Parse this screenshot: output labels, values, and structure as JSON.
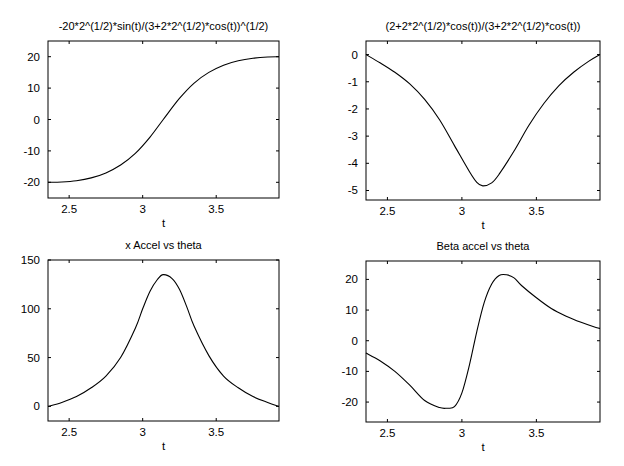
{
  "chart_data": [
    {
      "type": "line",
      "id": "tl",
      "title": "-20*2^(1/2)*sin(t)/(3+2*2^(1/2)*cos(t))^(1/2)",
      "xlabel": "t",
      "ylabel": "",
      "xlim": [
        2.3562,
        3.927
      ],
      "ylim": [
        -25,
        25
      ],
      "xticks": [
        2.5,
        3,
        3.5
      ],
      "xtick_labels": [
        "2.5",
        "3",
        "3.5"
      ],
      "yticks": [
        20,
        10,
        0,
        -10,
        -20
      ],
      "ytick_labels": [
        "20",
        "10",
        "0",
        "-10",
        "-20"
      ],
      "box": {
        "left": 48,
        "top": 41,
        "right": 279,
        "bottom": 198
      },
      "x": [
        2.356,
        2.45,
        2.55,
        2.65,
        2.75,
        2.85,
        2.95,
        3.05,
        3.14,
        3.25,
        3.35,
        3.45,
        3.55,
        3.65,
        3.75,
        3.85,
        3.927
      ],
      "values": [
        -20,
        -19.9,
        -19.5,
        -18.6,
        -17.0,
        -14.5,
        -10.8,
        -5.6,
        0,
        6.7,
        11.6,
        15.0,
        17.3,
        18.7,
        19.5,
        19.9,
        20
      ]
    },
    {
      "type": "line",
      "id": "tr",
      "title": "(2+2*2^(1/2)*cos(t))/(3+2*2^(1/2)*cos(t))",
      "xlabel": "t",
      "ylabel": "",
      "xlim": [
        2.3562,
        3.927
      ],
      "ylim": [
        -5.35,
        0.5
      ],
      "xticks": [
        2.5,
        3,
        3.5
      ],
      "xtick_labels": [
        "2.5",
        "3",
        "3.5"
      ],
      "yticks": [
        0,
        -1,
        -2,
        -3,
        -4,
        -5
      ],
      "ytick_labels": [
        "0",
        "-1",
        "-2",
        "-3",
        "-4",
        "-5"
      ],
      "box": {
        "left": 366,
        "top": 41,
        "right": 600,
        "bottom": 200
      },
      "x": [
        2.356,
        2.45,
        2.55,
        2.65,
        2.75,
        2.85,
        2.95,
        3.05,
        3.1,
        3.14,
        3.2,
        3.25,
        3.35,
        3.45,
        3.55,
        3.65,
        3.75,
        3.85,
        3.927
      ],
      "values": [
        0,
        -0.3,
        -0.65,
        -1.08,
        -1.65,
        -2.4,
        -3.35,
        -4.3,
        -4.7,
        -4.83,
        -4.72,
        -4.4,
        -3.55,
        -2.6,
        -1.8,
        -1.15,
        -0.65,
        -0.25,
        0
      ]
    },
    {
      "type": "line",
      "id": "bl",
      "title": "x Accel vs theta",
      "xlabel": "t",
      "ylabel": "",
      "xlim": [
        2.3562,
        3.927
      ],
      "ylim": [
        -15,
        150
      ],
      "xticks": [
        2.5,
        3,
        3.5
      ],
      "xtick_labels": [
        "2.5",
        "3",
        "3.5"
      ],
      "yticks": [
        150,
        100,
        50,
        0
      ],
      "ytick_labels": [
        "150",
        "100",
        "50",
        "0"
      ],
      "box": {
        "left": 48,
        "top": 260,
        "right": 279,
        "bottom": 421
      },
      "x": [
        2.356,
        2.45,
        2.55,
        2.65,
        2.75,
        2.85,
        2.95,
        3.0,
        3.05,
        3.1,
        3.14,
        3.2,
        3.25,
        3.3,
        3.35,
        3.45,
        3.55,
        3.65,
        3.75,
        3.85,
        3.927
      ],
      "values": [
        0,
        4,
        10,
        19,
        31,
        50,
        80,
        100,
        118,
        130,
        135,
        131,
        120,
        102,
        82,
        52,
        31,
        19,
        10,
        4,
        0
      ]
    },
    {
      "type": "line",
      "id": "br",
      "title": "Beta accel vs theta",
      "xlabel": "t",
      "ylabel": "",
      "xlim": [
        2.3562,
        3.927
      ],
      "ylim": [
        -26.5,
        26
      ],
      "xticks": [
        2.5,
        3,
        3.5
      ],
      "xtick_labels": [
        "2.5",
        "3",
        "3.5"
      ],
      "yticks": [
        20,
        10,
        0,
        -10,
        -20
      ],
      "ytick_labels": [
        "20",
        "10",
        "0",
        "-10",
        "-20"
      ],
      "box": {
        "left": 366,
        "top": 261,
        "right": 600,
        "bottom": 422
      },
      "x": [
        2.356,
        2.45,
        2.55,
        2.65,
        2.75,
        2.85,
        2.9,
        2.95,
        3.0,
        3.05,
        3.1,
        3.15,
        3.2,
        3.25,
        3.3,
        3.35,
        3.4,
        3.5,
        3.6,
        3.7,
        3.8,
        3.9,
        3.927
      ],
      "values": [
        -4,
        -6.5,
        -10,
        -14.5,
        -19.5,
        -21.8,
        -22,
        -21.5,
        -17,
        -8,
        3,
        12.5,
        18.5,
        21.3,
        21.5,
        20.5,
        18,
        14,
        10.5,
        8,
        6,
        4.3,
        4
      ]
    }
  ]
}
